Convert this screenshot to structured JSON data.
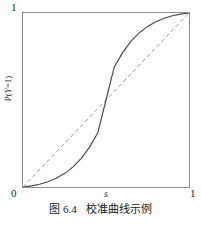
{
  "figure": {
    "caption_number": "图 6.4",
    "caption_text": "校准曲线示例"
  },
  "axes": {
    "y_max_label": "1",
    "origin_label": "0",
    "x_max_label": "1",
    "x_axis_title": "s",
    "y_axis_title_prefix": "P(",
    "y_axis_title_var": "Y",
    "y_axis_title_suffix": "=1)"
  },
  "colors": {
    "frame": "#8e8e8e",
    "curve": "#4a4a4a",
    "reference": "#9b9b9b",
    "background": "#ffffff",
    "text": "#1a1a1a"
  },
  "chart_data": {
    "type": "line",
    "xlabel": "s",
    "ylabel": "P(Y=1)",
    "xlim": [
      0,
      1
    ],
    "ylim": [
      0,
      1
    ],
    "xticks": [
      0,
      1
    ],
    "xticklabels": [
      "0",
      "1"
    ],
    "yticks": [
      0,
      1
    ],
    "yticklabels": [
      "0",
      "1"
    ],
    "grid": false,
    "legend": null,
    "series": [
      {
        "name": "calibration-curve",
        "style": "solid",
        "color": "#4a4a4a",
        "x": [
          0.0,
          0.05,
          0.1,
          0.15,
          0.2,
          0.25,
          0.3,
          0.35,
          0.4,
          0.45,
          0.5,
          0.55,
          0.6,
          0.65,
          0.7,
          0.75,
          0.8,
          0.85,
          0.9,
          0.95,
          1.0
        ],
        "y": [
          0.0,
          0.006,
          0.016,
          0.03,
          0.05,
          0.077,
          0.114,
          0.163,
          0.228,
          0.31,
          0.5,
          0.69,
          0.772,
          0.837,
          0.886,
          0.923,
          0.95,
          0.97,
          0.984,
          0.994,
          1.0
        ]
      },
      {
        "name": "perfect-calibration-reference",
        "style": "dashed",
        "color": "#9b9b9b",
        "x": [
          0.0,
          1.0
        ],
        "y": [
          0.0,
          1.0
        ]
      }
    ],
    "annotations": [
      {
        "text": "crossing point at (0.5, 0.5)",
        "x": 0.5,
        "y": 0.5
      }
    ]
  }
}
